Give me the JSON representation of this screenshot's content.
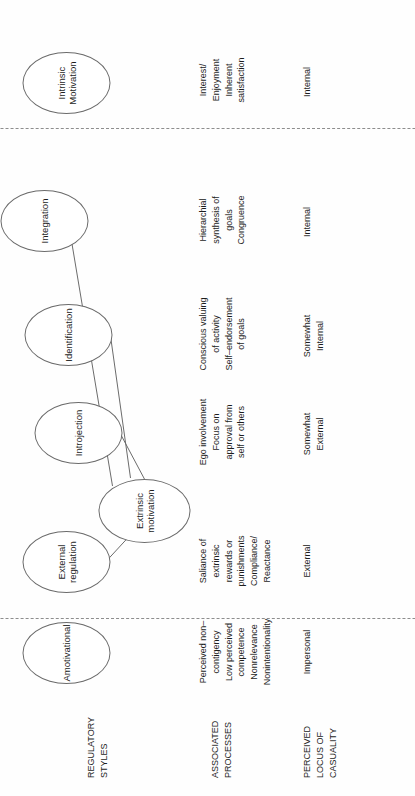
{
  "figure": {
    "orientation": "rotated-90-ccw",
    "line_color": "#6b6b6b",
    "divider_color": "#8d8d8d",
    "text_color": "#1d1d1d",
    "background": "#fefefe"
  },
  "row_labels": {
    "regulatory_styles": "REGULATORY\nSTYLES",
    "associated_processes": "ASSOCIATED\nPROCESSES",
    "perceived_locus": "PERCEIVED\nLOCUS OF\nCASUALITY"
  },
  "hub": {
    "label": "Extrinsic motivation"
  },
  "columns": [
    {
      "key": "amotivational",
      "style": "Amotivational",
      "processes": "Perceived non–\ncontigency\nLow perceived\ncompetence\nNonrelevance\nNonintentionality",
      "locus": "Impersonal"
    },
    {
      "key": "external_regulation",
      "style": "External\nregulation",
      "processes": "Saliance of\nextrinsic\nrewards or\npunishments\nCompliance/\nReactance",
      "locus": "External"
    },
    {
      "key": "introjection",
      "style": "Introjection",
      "processes": "Ego involvement\nFocus on\napproval from\nself or others",
      "locus": "Somewhat\nExternal"
    },
    {
      "key": "identification",
      "style": "Identification",
      "processes": "Conscious valuing\nof activity\nSelf–endorsement\nof goals",
      "locus": "Somewhat\nInternal"
    },
    {
      "key": "integration",
      "style": "Integration",
      "processes": "Hierarchial\nsynthesis of\ngoals\nCongruence",
      "locus": "Internal"
    },
    {
      "key": "intrinsic_motivation",
      "style": "Intrinsic\nMotivation",
      "processes": "Interest/\nEnjoyment\nInherent\nsatisfaction",
      "locus": "Internal"
    }
  ]
}
